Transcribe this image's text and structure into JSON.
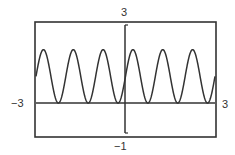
{
  "chart_data": {
    "type": "line",
    "title": "",
    "xlabel": "",
    "ylabel": "",
    "xlim": [
      -3,
      3
    ],
    "ylim": [
      -1,
      3
    ],
    "grid": false,
    "legend": null,
    "function": "y = 1 + sin(2πx)",
    "series": [
      {
        "name": "y",
        "x": [
          -3,
          -2.75,
          -2.5,
          -2.25,
          -2,
          -1.75,
          -1.5,
          -1.25,
          -1,
          -0.75,
          -0.5,
          -0.25,
          0,
          0.25,
          0.5,
          0.75,
          1,
          1.25,
          1.5,
          1.75,
          2,
          2.25,
          2.5,
          2.75,
          3
        ],
        "values": [
          1,
          2,
          1,
          0,
          1,
          2,
          1,
          0,
          1,
          2,
          1,
          0,
          1,
          2,
          1,
          0,
          1,
          2,
          1,
          0,
          1,
          2,
          1,
          0,
          1
        ]
      }
    ],
    "window_labels": {
      "ymax": "3",
      "ymin": "−1",
      "xmin": "−3",
      "xmax": "3"
    }
  },
  "colors": {
    "curve": "#333333",
    "frame": "#333333",
    "background": "#ffffff"
  }
}
